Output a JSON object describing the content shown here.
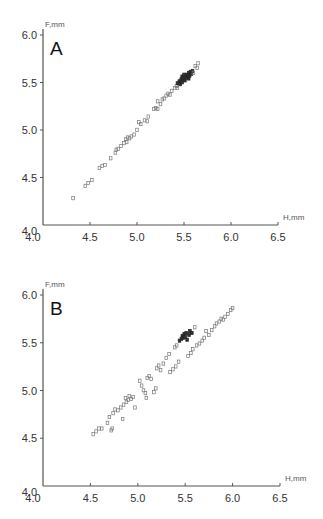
{
  "chart_data": [
    {
      "type": "scatter",
      "panel": "A",
      "title": "A",
      "xlabel": "H,mm",
      "ylabel": "F,mm",
      "xlim": [
        4.0,
        6.5
      ],
      "ylim": [
        4.0,
        6.0
      ],
      "xticks": [
        "4.0",
        "4.5",
        "5.0",
        "5.5",
        "6.0",
        "6.5"
      ],
      "yticks": [
        "4.0",
        "4.5",
        "5.0",
        "5.5",
        "6.0"
      ],
      "grid": false,
      "legend": null,
      "series": [
        {
          "name": "A",
          "points": [
            [
              4.32,
              4.28
            ],
            [
              4.45,
              4.41
            ],
            [
              4.48,
              4.44
            ],
            [
              4.52,
              4.47
            ],
            [
              4.6,
              4.6
            ],
            [
              4.63,
              4.62
            ],
            [
              4.66,
              4.63
            ],
            [
              4.72,
              4.7
            ],
            [
              4.77,
              4.76
            ],
            [
              4.78,
              4.79
            ],
            [
              4.8,
              4.8
            ],
            [
              4.83,
              4.83
            ],
            [
              4.86,
              4.86
            ],
            [
              4.88,
              4.9
            ],
            [
              4.89,
              4.87
            ],
            [
              4.9,
              4.92
            ],
            [
              4.92,
              4.91
            ],
            [
              4.94,
              4.93
            ],
            [
              4.97,
              4.95
            ],
            [
              5.0,
              5.0
            ],
            [
              5.02,
              5.08
            ],
            [
              5.04,
              5.06
            ],
            [
              5.08,
              5.1
            ],
            [
              5.11,
              5.09
            ],
            [
              5.12,
              5.14
            ],
            [
              5.18,
              5.22
            ],
            [
              5.2,
              5.23
            ],
            [
              5.22,
              5.22
            ],
            [
              5.22,
              5.3
            ],
            [
              5.25,
              5.27
            ],
            [
              5.27,
              5.32
            ],
            [
              5.29,
              5.33
            ],
            [
              5.31,
              5.36
            ],
            [
              5.33,
              5.38
            ],
            [
              5.35,
              5.37
            ],
            [
              5.37,
              5.41
            ],
            [
              5.4,
              5.44
            ],
            [
              5.42,
              5.46
            ],
            [
              5.43,
              5.44
            ],
            [
              5.43,
              5.49
            ],
            [
              5.45,
              5.51
            ],
            [
              5.46,
              5.48
            ],
            [
              5.47,
              5.53
            ],
            [
              5.48,
              5.5
            ],
            [
              5.48,
              5.56
            ],
            [
              5.49,
              5.54
            ],
            [
              5.5,
              5.58
            ],
            [
              5.51,
              5.52
            ],
            [
              5.52,
              5.55
            ],
            [
              5.53,
              5.58
            ],
            [
              5.54,
              5.56
            ],
            [
              5.55,
              5.6
            ],
            [
              5.55,
              5.54
            ],
            [
              5.56,
              5.57
            ],
            [
              5.57,
              5.61
            ],
            [
              5.58,
              5.59
            ],
            [
              5.59,
              5.62
            ],
            [
              5.6,
              5.6
            ],
            [
              5.62,
              5.67
            ],
            [
              5.64,
              5.65
            ],
            [
              5.65,
              5.7
            ]
          ]
        }
      ]
    },
    {
      "type": "scatter",
      "panel": "B",
      "title": "B",
      "xlabel": "H,mm",
      "ylabel": "F,mm",
      "xlim": [
        4.0,
        6.5
      ],
      "ylim": [
        4.0,
        6.0
      ],
      "xticks": [
        "4.0",
        "4.5",
        "5.0",
        "5.5",
        "6.0",
        "6.5"
      ],
      "yticks": [
        "4.0",
        "4.5",
        "5.0",
        "5.5",
        "6.0"
      ],
      "grid": false,
      "legend": null,
      "series": [
        {
          "name": "B",
          "points": [
            [
              4.53,
              4.54
            ],
            [
              4.56,
              4.57
            ],
            [
              4.59,
              4.6
            ],
            [
              4.62,
              4.6
            ],
            [
              4.68,
              4.66
            ],
            [
              4.7,
              4.72
            ],
            [
              4.72,
              4.58
            ],
            [
              4.73,
              4.6
            ],
            [
              4.74,
              4.76
            ],
            [
              4.76,
              4.8
            ],
            [
              4.79,
              4.79
            ],
            [
              4.82,
              4.82
            ],
            [
              4.84,
              4.7
            ],
            [
              4.85,
              4.85
            ],
            [
              4.87,
              4.92
            ],
            [
              4.88,
              4.88
            ],
            [
              4.9,
              4.9
            ],
            [
              4.91,
              4.94
            ],
            [
              4.93,
              4.91
            ],
            [
              4.95,
              4.93
            ],
            [
              4.97,
              4.82
            ],
            [
              5.02,
              5.1
            ],
            [
              5.04,
              5.05
            ],
            [
              5.06,
              5.0
            ],
            [
              5.08,
              4.97
            ],
            [
              5.09,
              4.92
            ],
            [
              5.1,
              5.13
            ],
            [
              5.12,
              5.15
            ],
            [
              5.14,
              5.12
            ],
            [
              5.17,
              4.98
            ],
            [
              5.19,
              5.02
            ],
            [
              5.2,
              5.23
            ],
            [
              5.22,
              5.26
            ],
            [
              5.24,
              5.21
            ],
            [
              5.27,
              5.28
            ],
            [
              5.3,
              5.34
            ],
            [
              5.33,
              5.38
            ],
            [
              5.34,
              5.19
            ],
            [
              5.37,
              5.22
            ],
            [
              5.39,
              5.45
            ],
            [
              5.4,
              5.25
            ],
            [
              5.41,
              5.47
            ],
            [
              5.43,
              5.3
            ],
            [
              5.44,
              5.52
            ],
            [
              5.46,
              5.54
            ],
            [
              5.47,
              5.57
            ],
            [
              5.48,
              5.55
            ],
            [
              5.49,
              5.59
            ],
            [
              5.5,
              5.56
            ],
            [
              5.51,
              5.6
            ],
            [
              5.52,
              5.53
            ],
            [
              5.53,
              5.36
            ],
            [
              5.54,
              5.58
            ],
            [
              5.55,
              5.62
            ],
            [
              5.56,
              5.39
            ],
            [
              5.57,
              5.6
            ],
            [
              5.58,
              5.43
            ],
            [
              5.6,
              5.66
            ],
            [
              5.62,
              5.47
            ],
            [
              5.65,
              5.49
            ],
            [
              5.68,
              5.52
            ],
            [
              5.7,
              5.55
            ],
            [
              5.72,
              5.62
            ],
            [
              5.75,
              5.58
            ],
            [
              5.78,
              5.63
            ],
            [
              5.81,
              5.67
            ],
            [
              5.83,
              5.7
            ],
            [
              5.86,
              5.72
            ],
            [
              5.88,
              5.75
            ],
            [
              5.9,
              5.74
            ],
            [
              5.92,
              5.77
            ],
            [
              5.95,
              5.8
            ],
            [
              5.98,
              5.84
            ],
            [
              6.0,
              5.86
            ]
          ]
        }
      ]
    }
  ],
  "panels": [
    {
      "letter": "A",
      "ylabel": "F,mm",
      "xlabel": "H,mm"
    },
    {
      "letter": "B",
      "ylabel": "F,mm",
      "xlabel": "H,mm"
    }
  ]
}
